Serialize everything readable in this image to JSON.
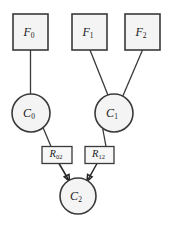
{
  "diagram": {
    "background_color": "#ffffff",
    "node_fill": "#f4f4f4",
    "node_stroke": "#3a3a3a",
    "nodes": [
      {
        "id": "F0",
        "shape": "square",
        "label": "F",
        "subscript": "0",
        "cx": 30.5,
        "cy": 32,
        "w": 35,
        "h": 36
      },
      {
        "id": "F1",
        "shape": "square",
        "label": "F",
        "subscript": "1",
        "cx": 90,
        "cy": 32,
        "w": 35,
        "h": 36
      },
      {
        "id": "F2",
        "shape": "square",
        "label": "F",
        "subscript": "2",
        "cx": 142.5,
        "cy": 32,
        "w": 35,
        "h": 36
      },
      {
        "id": "C0",
        "shape": "circle",
        "label": "C",
        "subscript": "0",
        "cx": 31,
        "cy": 113,
        "r": 19
      },
      {
        "id": "C1",
        "shape": "circle",
        "label": "C",
        "subscript": "1",
        "cx": 114,
        "cy": 113,
        "r": 19
      },
      {
        "id": "R02",
        "shape": "rect",
        "label": "R",
        "subscript": "02",
        "cx": 57,
        "cy": 155,
        "w": 30,
        "h": 17
      },
      {
        "id": "R12",
        "shape": "rect",
        "label": "R",
        "subscript": "12",
        "cx": 99,
        "cy": 155,
        "w": 29,
        "h": 17
      },
      {
        "id": "C2",
        "shape": "circle",
        "label": "C",
        "subscript": "2",
        "cx": 78,
        "cy": 196,
        "r": 18
      }
    ],
    "edges": [
      {
        "id": "F0-C0",
        "from": "F0",
        "to": "C0",
        "arrow": false
      },
      {
        "id": "F1-C1",
        "from": "F1",
        "to": "C1",
        "arrow": false
      },
      {
        "id": "F2-C1",
        "from": "F2",
        "to": "C1",
        "arrow": false
      },
      {
        "id": "C0-R02",
        "from": "C0",
        "to": "R02",
        "arrow": false
      },
      {
        "id": "C1-R12",
        "from": "C1",
        "to": "R12",
        "arrow": false
      },
      {
        "id": "R02-C2",
        "from": "R02",
        "to": "C2",
        "arrow": true
      },
      {
        "id": "R12-C2",
        "from": "R12",
        "to": "C2",
        "arrow": true
      }
    ]
  }
}
